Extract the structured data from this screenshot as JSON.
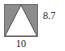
{
  "figure": {
    "name": "triangle-inscribed-in-square",
    "square": {
      "fill_color": "#8c8c8c",
      "stroke_color": "#6e6e6e",
      "x": 4,
      "y": 4,
      "width": 34,
      "height": 33
    },
    "triangle": {
      "fill_color": "#ffffff",
      "stroke_color": "#5a5a5a",
      "apex": {
        "x": 21,
        "y": 5
      },
      "base_left": {
        "x": 5,
        "y": 36
      },
      "base_right": {
        "x": 37,
        "y": 36
      }
    },
    "background_color": "#ffffff",
    "text_color": "#1a1a1a"
  },
  "labels": {
    "height": "8.7",
    "base": "10"
  }
}
